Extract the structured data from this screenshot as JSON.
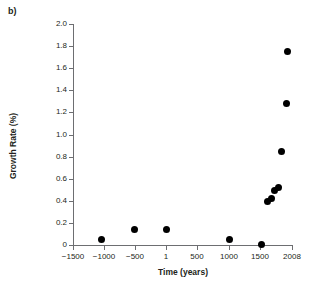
{
  "panel": {
    "label": "b)"
  },
  "chart_data": {
    "type": "scatter",
    "title": "",
    "xlabel": "Time (years)",
    "ylabel": "Growth Rate (%)",
    "xlim": [
      -1500,
      2008
    ],
    "ylim": [
      0,
      2.0
    ],
    "grid": false,
    "legend": null,
    "marker": {
      "shape": "circle",
      "color": "#000000",
      "size_px": 7
    },
    "axis_color": "#6d6e71",
    "text_color": "#231f20",
    "x_ticks": [
      -1500,
      -1000,
      -500,
      1,
      500,
      1000,
      1500,
      2008
    ],
    "x_tick_labels": [
      "−1500",
      "−1000",
      "−500",
      "1",
      "500",
      "1000",
      "1500",
      "2008"
    ],
    "x_tick_positions_px": [
      73,
      104,
      135,
      166,
      197,
      229,
      260,
      292
    ],
    "y_ticks": [
      0,
      0.2,
      0.4,
      0.6,
      0.8,
      1.0,
      1.2,
      1.4,
      1.6,
      1.8,
      2.0
    ],
    "y_tick_labels": [
      "0",
      "0.2",
      "0.4",
      "0.6",
      "0.8",
      "1.0",
      "1.2",
      "1.4",
      "1.6",
      "1.8",
      "2.0"
    ],
    "x": [
      -1000,
      -500,
      1,
      1050,
      1500,
      1700,
      1750,
      1800,
      1830,
      1870,
      1920,
      1960
    ],
    "y": [
      0.05,
      0.14,
      0.14,
      0.05,
      0.01,
      0.4,
      0.43,
      0.52,
      0.55,
      0.85,
      1.29,
      1.78
    ],
    "points": [
      {
        "x": -1000,
        "y": 0.05,
        "px": 101,
        "py": 239
      },
      {
        "x": -500,
        "y": 0.14,
        "px": 134,
        "py": 229
      },
      {
        "x": 1,
        "y": 0.14,
        "px": 166,
        "py": 229
      },
      {
        "x": 1050,
        "y": 0.05,
        "px": 229,
        "py": 239
      },
      {
        "x": 1500,
        "y": 0.01,
        "px": 261,
        "py": 244
      },
      {
        "x": 1700,
        "y": 0.4,
        "px": 267,
        "py": 201
      },
      {
        "x": 1750,
        "y": 0.43,
        "px": 271,
        "py": 198
      },
      {
        "x": 1800,
        "y": 0.52,
        "px": 274,
        "py": 190
      },
      {
        "x": 1830,
        "y": 0.55,
        "px": 278,
        "py": 187
      },
      {
        "x": 1870,
        "y": 0.85,
        "px": 281,
        "py": 151
      },
      {
        "x": 1920,
        "y": 1.29,
        "px": 286,
        "py": 103
      },
      {
        "x": 1960,
        "y": 1.78,
        "px": 287,
        "py": 51
      }
    ]
  }
}
